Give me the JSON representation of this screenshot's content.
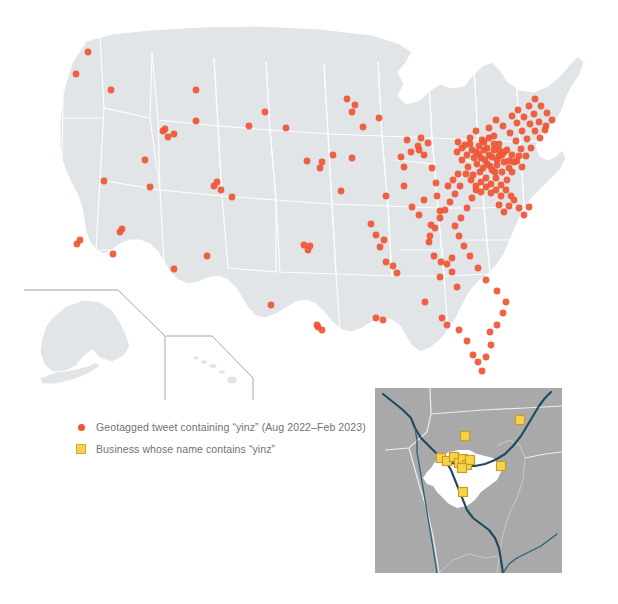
{
  "figure": {
    "title_visible": false,
    "background_color": "#ffffff"
  },
  "colors": {
    "land": "#e2e5e8",
    "land_border": "#ffffff",
    "tweet_dot": "#ef5533",
    "business_square_fill": "#f5d44c",
    "business_square_border": "#c99c22",
    "legend_text": "#6e7276",
    "inset_background": "#a9a9a9",
    "inset_city": "#ffffff",
    "inset_river": "#1d4a5e",
    "inset_county_line": "#eceded",
    "inset_frame_line": "#9a9a9a"
  },
  "legend": {
    "items": [
      {
        "marker": "dot-marker",
        "label": "Geotagged tweet containing “yinz” (Aug 2022–Feb 2023)"
      },
      {
        "marker": "square-marker",
        "label": "Business whose name contains “yinz”"
      }
    ]
  },
  "chart_data": {
    "type": "scatter",
    "title": "",
    "subtitle": "",
    "xlabel": "",
    "ylabel": "",
    "projection": "albers-usa",
    "basemap": "United States (50 states, Alaska and Hawaii shown as insets)",
    "legend_position": "lower-left",
    "grid": false,
    "series": [
      {
        "name": "Geotagged tweet containing “yinz” (Aug 2022–Feb 2023)",
        "marker": "circle",
        "color": "#ef5533",
        "count": 213,
        "points": [
          [
            88,
            52
          ],
          [
            76,
            74
          ],
          [
            104,
            181
          ],
          [
            111,
            90
          ],
          [
            196,
            90
          ],
          [
            145,
            160
          ],
          [
            163,
            131
          ],
          [
            165,
            129
          ],
          [
            174,
            134
          ],
          [
            168,
            137
          ],
          [
            120,
            232
          ],
          [
            122,
            229
          ],
          [
            80,
            240
          ],
          [
            77,
            244
          ],
          [
            113,
            254
          ],
          [
            150,
            187
          ],
          [
            196,
            121
          ],
          [
            214,
            186
          ],
          [
            217,
            182
          ],
          [
            221,
            190
          ],
          [
            232,
            197
          ],
          [
            207,
            256
          ],
          [
            174,
            269
          ],
          [
            271,
            305
          ],
          [
            304,
            245
          ],
          [
            310,
            246
          ],
          [
            308,
            250
          ],
          [
            317,
            325
          ],
          [
            322,
            330
          ],
          [
            318,
            327
          ],
          [
            249,
            126
          ],
          [
            265,
            112
          ],
          [
            286,
            128
          ],
          [
            307,
            161
          ],
          [
            322,
            162
          ],
          [
            320,
            168
          ],
          [
            333,
            155
          ],
          [
            347,
            99
          ],
          [
            352,
            112
          ],
          [
            355,
            105
          ],
          [
            341,
            191
          ],
          [
            352,
            158
          ],
          [
            363,
            127
          ],
          [
            379,
            118
          ],
          [
            386,
            196
          ],
          [
            371,
            224
          ],
          [
            376,
            235
          ],
          [
            384,
            240
          ],
          [
            380,
            247
          ],
          [
            386,
            262
          ],
          [
            393,
            266
          ],
          [
            397,
            273
          ],
          [
            376,
            318
          ],
          [
            383,
            320
          ],
          [
            401,
            157
          ],
          [
            404,
            167
          ],
          [
            407,
            140
          ],
          [
            411,
            152
          ],
          [
            404,
            186
          ],
          [
            418,
            146
          ],
          [
            419,
            150
          ],
          [
            421,
            138
          ],
          [
            424,
            155
          ],
          [
            428,
            143
          ],
          [
            432,
            168
          ],
          [
            436,
            183
          ],
          [
            412,
            207
          ],
          [
            419,
            215
          ],
          [
            424,
            200
          ],
          [
            431,
            225
          ],
          [
            437,
            196
          ],
          [
            440,
            211
          ],
          [
            429,
            242
          ],
          [
            434,
            256
          ],
          [
            441,
            262
          ],
          [
            447,
            264
          ],
          [
            452,
            258
          ],
          [
            440,
            277
          ],
          [
            452,
            272
          ],
          [
            457,
            287
          ],
          [
            425,
            302
          ],
          [
            442,
            318
          ],
          [
            447,
            325
          ],
          [
            459,
            330
          ],
          [
            467,
            341
          ],
          [
            473,
            355
          ],
          [
            478,
            362
          ],
          [
            482,
            371
          ],
          [
            486,
            357
          ],
          [
            491,
            345
          ],
          [
            490,
            332
          ],
          [
            497,
            325
          ],
          [
            503,
            313
          ],
          [
            506,
            302
          ],
          [
            497,
            291
          ],
          [
            486,
            280
          ],
          [
            478,
            268
          ],
          [
            470,
            256
          ],
          [
            464,
            246
          ],
          [
            459,
            236
          ],
          [
            455,
            226
          ],
          [
            461,
            218
          ],
          [
            467,
            208
          ],
          [
            472,
            198
          ],
          [
            476,
            190
          ],
          [
            481,
            182
          ],
          [
            473,
            175
          ],
          [
            468,
            167
          ],
          [
            462,
            160
          ],
          [
            457,
            152
          ],
          [
            465,
            145
          ],
          [
            470,
            138
          ],
          [
            476,
            131
          ],
          [
            482,
            140
          ],
          [
            487,
            148
          ],
          [
            492,
            157
          ],
          [
            497,
            165
          ],
          [
            502,
            172
          ],
          [
            507,
            180
          ],
          [
            512,
            172
          ],
          [
            509,
            161
          ],
          [
            504,
            152
          ],
          [
            499,
            144
          ],
          [
            494,
            136
          ],
          [
            489,
            128
          ],
          [
            496,
            120
          ],
          [
            503,
            126
          ],
          [
            510,
            133
          ],
          [
            516,
            141
          ],
          [
            521,
            149
          ],
          [
            526,
            156
          ],
          [
            531,
            148
          ],
          [
            527,
            139
          ],
          [
            522,
            131
          ],
          [
            517,
            123
          ],
          [
            512,
            116
          ],
          [
            518,
            110
          ],
          [
            524,
            117
          ],
          [
            530,
            124
          ],
          [
            535,
            131
          ],
          [
            540,
            138
          ],
          [
            545,
            130
          ],
          [
            539,
            122
          ],
          [
            534,
            114
          ],
          [
            529,
            106
          ],
          [
            535,
            99
          ],
          [
            541,
            106
          ],
          [
            547,
            113
          ],
          [
            552,
            120
          ],
          [
            546,
            126
          ],
          [
            485,
            160
          ],
          [
            490,
            166
          ],
          [
            495,
            172
          ],
          [
            480,
            172
          ],
          [
            486,
            178
          ],
          [
            491,
            184
          ],
          [
            496,
            178
          ],
          [
            501,
            185
          ],
          [
            477,
            164
          ],
          [
            483,
            168
          ],
          [
            474,
            158
          ],
          [
            479,
            154
          ],
          [
            484,
            150
          ],
          [
            489,
            155
          ],
          [
            494,
            150
          ],
          [
            499,
            156
          ],
          [
            504,
            162
          ],
          [
            509,
            168
          ],
          [
            514,
            162
          ],
          [
            519,
            156
          ],
          [
            479,
            146
          ],
          [
            484,
            142
          ],
          [
            489,
            138
          ],
          [
            494,
            144
          ],
          [
            499,
            150
          ],
          [
            472,
            150
          ],
          [
            467,
            155
          ],
          [
            462,
            148
          ],
          [
            458,
            142
          ],
          [
            470,
            144
          ],
          [
            476,
            152
          ],
          [
            481,
            158
          ],
          [
            487,
            164
          ],
          [
            492,
            170
          ],
          [
            497,
            160
          ],
          [
            502,
            155
          ],
          [
            507,
            150
          ],
          [
            512,
            155
          ],
          [
            517,
            161
          ],
          [
            522,
            167
          ],
          [
            466,
            174
          ],
          [
            471,
            180
          ],
          [
            476,
            186
          ],
          [
            481,
            192
          ],
          [
            486,
            187
          ],
          [
            491,
            193
          ],
          [
            496,
            190
          ],
          [
            501,
            196
          ],
          [
            506,
            190
          ],
          [
            511,
            196
          ],
          [
            460,
            186
          ],
          [
            455,
            194
          ],
          [
            450,
            202
          ],
          [
            445,
            210
          ],
          [
            440,
            218
          ],
          [
            435,
            228
          ],
          [
            430,
            236
          ],
          [
            448,
            186
          ],
          [
            453,
            180
          ],
          [
            458,
            174
          ],
          [
            499,
            205
          ],
          [
            504,
            212
          ],
          [
            509,
            206
          ],
          [
            514,
            200
          ],
          [
            519,
            208
          ],
          [
            524,
            215
          ],
          [
            529,
            207
          ]
        ]
      }
    ],
    "inset": {
      "name": "Pittsburgh metropolitan area detail",
      "series_name": "Business whose name contains “yinz”",
      "marker": "square",
      "color": "#f5d44c",
      "count": 12,
      "points": [
        [
          145,
          32
        ],
        [
          90,
          48
        ],
        [
          66,
          70
        ],
        [
          72,
          73
        ],
        [
          79,
          69
        ],
        [
          84,
          75
        ],
        [
          88,
          71
        ],
        [
          92,
          77
        ],
        [
          95,
          72
        ],
        [
          87,
          80
        ],
        [
          126,
          78
        ],
        [
          88,
          104
        ]
      ]
    }
  }
}
